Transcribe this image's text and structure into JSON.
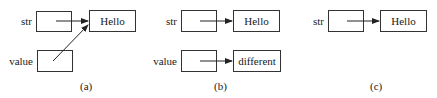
{
  "panels": [
    {
      "caption": "(a)",
      "variables": [
        {
          "name": "str"
        },
        {
          "name": "value"
        }
      ],
      "objects": [
        {
          "text": "Hello"
        }
      ],
      "references": [
        {
          "from": "str",
          "to": "Hello"
        },
        {
          "from": "value",
          "to": "Hello"
        }
      ]
    },
    {
      "caption": "(b)",
      "variables": [
        {
          "name": "str"
        },
        {
          "name": "value"
        }
      ],
      "objects": [
        {
          "text": "Hello"
        },
        {
          "text": "different"
        }
      ],
      "references": [
        {
          "from": "str",
          "to": "Hello"
        },
        {
          "from": "value",
          "to": "different"
        }
      ]
    },
    {
      "caption": "(c)",
      "variables": [
        {
          "name": "str"
        }
      ],
      "objects": [
        {
          "text": "Hello"
        }
      ],
      "references": [
        {
          "from": "str",
          "to": "Hello"
        }
      ]
    }
  ],
  "colors": {
    "stroke": "#333333",
    "text": "#1a1a1a",
    "background": "#ffffff"
  }
}
